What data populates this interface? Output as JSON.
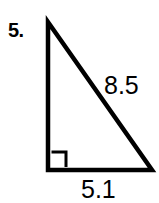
{
  "figure": {
    "problem_number": "5.",
    "shape_name": "right-triangle",
    "stroke_color": "#000000",
    "background_color": "#ffffff",
    "labels": {
      "hypotenuse": "8.5",
      "base": "5.1"
    },
    "right_angle_marker": {
      "name": "right-angle-square",
      "present": true,
      "vertex": "bottom-left"
    },
    "vertices": {
      "apex": [
        48,
        22
      ],
      "bottom_left": [
        48,
        170
      ],
      "bottom_right": [
        152,
        170
      ]
    }
  }
}
